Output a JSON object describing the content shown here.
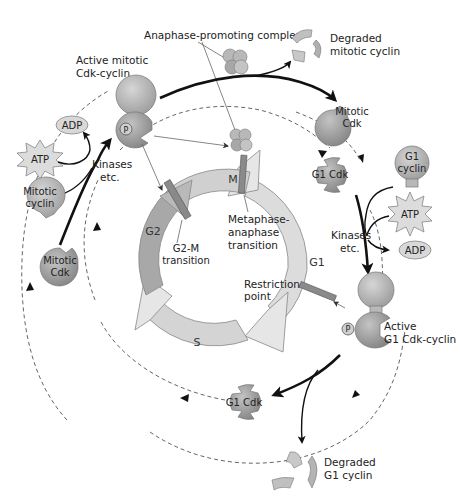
{
  "colors": {
    "ring_light": "#d6d6d6",
    "ring_g2": "#a9a9a9",
    "arrowhead_fill": "#e6e6e6",
    "protein_dark": "#9a9a9a",
    "protein_mid": "#b4b4b4",
    "checkpoint_bar": "#8a8a8a",
    "line": "#111111",
    "dashed": "#555555"
  },
  "labels": {
    "apc": "Anaphase-promoting complex",
    "degraded_mitotic_1": "Degraded",
    "degraded_mitotic_2": "mitotic cyclin",
    "active_mitotic_1": "Active mitotic",
    "active_mitotic_2": "Cdk-cyclin",
    "adp_left": "ADP",
    "atp_left": "ATP",
    "kinases_left_1": "Kinases",
    "kinases_left_2": "etc.",
    "mitotic_cyclin_1": "Mitotic",
    "mitotic_cyclin_2": "cyclin",
    "mitotic_cdk_left_1": "Mitotic",
    "mitotic_cdk_left_2": "Cdk",
    "mitotic_cdk_right_1": "Mitotic",
    "mitotic_cdk_right_2": "Cdk",
    "g1_cdk_top": "G1 Cdk",
    "g1_cyclin_1": "G1",
    "g1_cyclin_2": "cyclin",
    "atp_right": "ATP",
    "adp_right": "ADP",
    "kinases_right_1": "Kinases",
    "kinases_right_2": "etc.",
    "active_g1_1": "Active",
    "active_g1_2": "G1 Cdk-cyclin",
    "g1_cdk_bottom": "G1 Cdk",
    "degraded_g1_1": "Degraded",
    "degraded_g1_2": "G1 cyclin",
    "phosphate": "P"
  },
  "phases": {
    "m": "M",
    "g1": "G1",
    "s": "S",
    "g2": "G2"
  },
  "transitions": {
    "g2m_1": "G2-M",
    "g2m_2": "transition",
    "meta_1": "Metaphase-",
    "meta_2": "anaphase",
    "meta_3": "transition",
    "restr_1": "Restriction",
    "restr_2": "point"
  }
}
